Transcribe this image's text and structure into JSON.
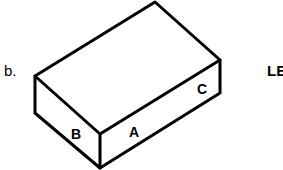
{
  "item_label": "b.",
  "side_label": "LE",
  "faces": {
    "a": "A",
    "b": "B",
    "c": "C"
  },
  "colors": {
    "stroke": "#000000",
    "background": "#ffffff"
  }
}
